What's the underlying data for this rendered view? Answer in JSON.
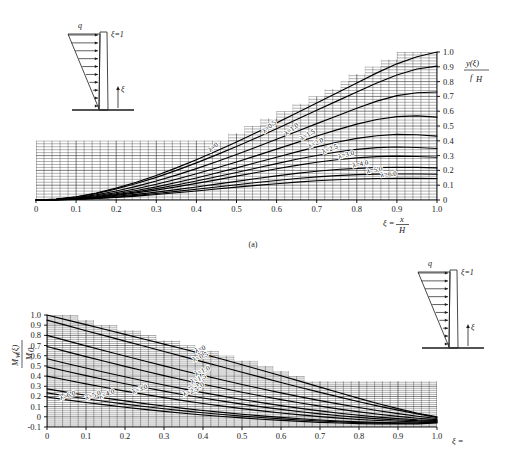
{
  "figure": {
    "panel_a_caption": "(a)",
    "lambda_prefix": "λ="
  },
  "chart_data": [
    {
      "type": "line",
      "id": "panel-a",
      "title": "",
      "xlabel": "ξ = x/H",
      "ylabel": "y(ξ)/f_H",
      "xlim": [
        0,
        1.0
      ],
      "ylim": [
        0,
        1.0
      ],
      "grid": true,
      "xticks": [
        0,
        0.1,
        0.2,
        0.3,
        0.4,
        0.5,
        0.6,
        0.7,
        0.8,
        0.9,
        1.0
      ],
      "xtick_labels": [
        "0",
        "0.1",
        "0.2",
        "0.3",
        "0.4",
        "0.5",
        "0.6",
        "0.7",
        "0.8",
        "0.9",
        "1.0"
      ],
      "yticks": [
        0,
        0.1,
        0.2,
        0.3,
        0.4,
        0.5,
        0.6,
        0.7,
        0.8,
        0.9,
        1.0
      ],
      "ytick_labels": [
        "0",
        "0.1",
        "0.2",
        "0.3",
        "0.4",
        "0.5",
        "0.6",
        "0.7",
        "0.8",
        "0.9",
        "1.0"
      ],
      "x": [
        0,
        0.05,
        0.1,
        0.15,
        0.2,
        0.25,
        0.3,
        0.35,
        0.4,
        0.45,
        0.5,
        0.55,
        0.6,
        0.65,
        0.7,
        0.75,
        0.8,
        0.85,
        0.9,
        0.95,
        1.0
      ],
      "series": [
        {
          "name": "λ=0",
          "label": "λ=0",
          "values": [
            0,
            0.006,
            0.022,
            0.047,
            0.08,
            0.12,
            0.166,
            0.217,
            0.272,
            0.331,
            0.392,
            0.456,
            0.521,
            0.588,
            0.655,
            0.723,
            0.791,
            0.859,
            0.92,
            0.968,
            1.0
          ]
        },
        {
          "name": "λ=0.5",
          "label": "λ=0.5",
          "values": [
            0,
            0.005,
            0.02,
            0.043,
            0.074,
            0.111,
            0.153,
            0.2,
            0.251,
            0.305,
            0.362,
            0.421,
            0.482,
            0.544,
            0.606,
            0.668,
            0.73,
            0.791,
            0.845,
            0.885,
            0.905
          ]
        },
        {
          "name": "λ=1.0",
          "label": "λ=1.0",
          "values": [
            0,
            0.004,
            0.016,
            0.035,
            0.061,
            0.092,
            0.128,
            0.168,
            0.212,
            0.258,
            0.307,
            0.358,
            0.41,
            0.463,
            0.516,
            0.568,
            0.62,
            0.668,
            0.705,
            0.725,
            0.73
          ]
        },
        {
          "name": "λ=1.5",
          "label": "λ=1.5",
          "values": [
            0,
            0.003,
            0.013,
            0.029,
            0.05,
            0.076,
            0.106,
            0.14,
            0.177,
            0.216,
            0.257,
            0.3,
            0.344,
            0.388,
            0.432,
            0.474,
            0.513,
            0.544,
            0.563,
            0.568,
            0.56
          ]
        },
        {
          "name": "λ=2.0",
          "label": "λ=2.0",
          "values": [
            0,
            0.003,
            0.011,
            0.024,
            0.042,
            0.064,
            0.089,
            0.118,
            0.149,
            0.182,
            0.217,
            0.253,
            0.289,
            0.325,
            0.359,
            0.39,
            0.416,
            0.434,
            0.443,
            0.441,
            0.432
          ]
        },
        {
          "name": "λ=2.5",
          "label": "λ=2.5",
          "values": [
            0,
            0.002,
            0.009,
            0.02,
            0.036,
            0.055,
            0.077,
            0.101,
            0.128,
            0.157,
            0.186,
            0.216,
            0.246,
            0.275,
            0.301,
            0.324,
            0.342,
            0.354,
            0.358,
            0.355,
            0.348
          ]
        },
        {
          "name": "λ=3.0",
          "label": "λ=3.0",
          "values": [
            0,
            0.002,
            0.008,
            0.018,
            0.031,
            0.048,
            0.067,
            0.089,
            0.112,
            0.136,
            0.161,
            0.186,
            0.211,
            0.234,
            0.255,
            0.272,
            0.285,
            0.293,
            0.296,
            0.294,
            0.289
          ]
        },
        {
          "name": "λ=4.0",
          "label": "λ=4.0",
          "values": [
            0,
            0.002,
            0.006,
            0.014,
            0.025,
            0.038,
            0.053,
            0.07,
            0.088,
            0.107,
            0.126,
            0.145,
            0.163,
            0.18,
            0.194,
            0.206,
            0.214,
            0.219,
            0.221,
            0.22,
            0.217
          ]
        },
        {
          "name": "λ=5.0",
          "label": "λ=5.0",
          "values": [
            0,
            0.001,
            0.005,
            0.011,
            0.02,
            0.031,
            0.044,
            0.058,
            0.073,
            0.088,
            0.103,
            0.118,
            0.132,
            0.145,
            0.156,
            0.165,
            0.171,
            0.175,
            0.176,
            0.176,
            0.174
          ]
        },
        {
          "name": "λ=6.0",
          "label": "λ=6.0",
          "values": [
            0,
            0.001,
            0.004,
            0.01,
            0.017,
            0.026,
            0.037,
            0.049,
            0.061,
            0.074,
            0.087,
            0.099,
            0.11,
            0.121,
            0.13,
            0.137,
            0.142,
            0.145,
            0.147,
            0.146,
            0.145
          ]
        }
      ]
    },
    {
      "type": "line",
      "id": "panel-b",
      "title": "",
      "xlabel": "ξ = x/H",
      "ylabel": "M_w(ξ)/M_0",
      "xlim": [
        0,
        1.0
      ],
      "ylim": [
        -0.1,
        1.0
      ],
      "grid": true,
      "xticks": [
        0,
        0.1,
        0.2,
        0.3,
        0.4,
        0.5,
        0.6,
        0.7,
        0.8,
        0.9,
        1.0
      ],
      "xtick_labels": [
        "0",
        "0.1",
        "0.2",
        "0.3",
        "0.4",
        "0.5",
        "0.6",
        "0.7",
        "0.8",
        "0.9",
        "1.0"
      ],
      "yticks": [
        -0.1,
        0,
        0.1,
        0.2,
        0.3,
        0.4,
        0.5,
        0.6,
        0.7,
        0.8,
        0.9,
        1.0
      ],
      "ytick_labels": [
        "-0.1",
        "0",
        "0.1",
        "0.2",
        "0.3",
        "0.4",
        "0.5",
        "0.6",
        "0.7",
        "0.8",
        "0.9",
        "1.0"
      ],
      "x": [
        0,
        0.05,
        0.1,
        0.15,
        0.2,
        0.25,
        0.3,
        0.35,
        0.4,
        0.45,
        0.5,
        0.55,
        0.6,
        0.65,
        0.7,
        0.75,
        0.8,
        0.85,
        0.9,
        0.95,
        1.0
      ],
      "series": [
        {
          "name": "λ=0",
          "label": "λ=0",
          "values": [
            1.0,
            0.952,
            0.905,
            0.857,
            0.81,
            0.762,
            0.714,
            0.666,
            0.616,
            0.565,
            0.512,
            0.458,
            0.403,
            0.348,
            0.292,
            0.236,
            0.181,
            0.128,
            0.08,
            0.035,
            0.0
          ]
        },
        {
          "name": "λ=0.5",
          "label": "λ=0.5",
          "values": [
            0.95,
            0.898,
            0.846,
            0.795,
            0.744,
            0.693,
            0.642,
            0.591,
            0.54,
            0.489,
            0.438,
            0.387,
            0.337,
            0.288,
            0.24,
            0.193,
            0.148,
            0.105,
            0.066,
            0.029,
            -0.005
          ]
        },
        {
          "name": "λ=1.0",
          "label": "λ=1.0",
          "values": [
            0.8,
            0.748,
            0.697,
            0.647,
            0.597,
            0.548,
            0.5,
            0.453,
            0.407,
            0.362,
            0.318,
            0.276,
            0.235,
            0.196,
            0.159,
            0.124,
            0.091,
            0.06,
            0.032,
            0.006,
            -0.016
          ]
        },
        {
          "name": "λ=1.5",
          "label": "λ=1.5",
          "values": [
            0.69,
            0.64,
            0.591,
            0.543,
            0.496,
            0.45,
            0.405,
            0.362,
            0.32,
            0.28,
            0.241,
            0.204,
            0.169,
            0.136,
            0.105,
            0.076,
            0.049,
            0.025,
            0.004,
            -0.014,
            -0.028
          ]
        },
        {
          "name": "λ=2.0",
          "label": "λ=2.0",
          "values": [
            0.57,
            0.524,
            0.479,
            0.435,
            0.393,
            0.352,
            0.312,
            0.274,
            0.238,
            0.203,
            0.17,
            0.139,
            0.11,
            0.083,
            0.058,
            0.035,
            0.015,
            -0.003,
            -0.018,
            -0.029,
            -0.035
          ]
        },
        {
          "name": "λ=2.5",
          "label": "λ=2.5",
          "values": [
            0.49,
            0.447,
            0.405,
            0.364,
            0.325,
            0.288,
            0.252,
            0.217,
            0.185,
            0.154,
            0.125,
            0.098,
            0.073,
            0.05,
            0.029,
            0.01,
            -0.006,
            -0.02,
            -0.031,
            -0.038,
            -0.04
          ]
        },
        {
          "name": "λ=3.0",
          "label": "λ=3.0",
          "values": [
            0.4,
            0.361,
            0.324,
            0.288,
            0.253,
            0.22,
            0.189,
            0.159,
            0.131,
            0.105,
            0.081,
            0.058,
            0.038,
            0.019,
            0.002,
            -0.013,
            -0.026,
            -0.036,
            -0.044,
            -0.048,
            -0.046
          ]
        },
        {
          "name": "λ=4.0",
          "label": "λ=4.0",
          "values": [
            0.275,
            0.243,
            0.212,
            0.183,
            0.156,
            0.13,
            0.106,
            0.083,
            0.062,
            0.043,
            0.025,
            0.009,
            -0.006,
            -0.019,
            -0.031,
            -0.041,
            -0.049,
            -0.055,
            -0.058,
            -0.058,
            -0.052
          ]
        },
        {
          "name": "λ=5.0",
          "label": "λ=5.0",
          "values": [
            0.235,
            0.205,
            0.177,
            0.15,
            0.125,
            0.101,
            0.079,
            0.059,
            0.04,
            0.023,
            0.007,
            -0.007,
            -0.02,
            -0.031,
            -0.041,
            -0.05,
            -0.057,
            -0.062,
            -0.064,
            -0.063,
            -0.056
          ]
        },
        {
          "name": "λ=6.0",
          "label": "λ=6.0",
          "values": [
            0.195,
            0.167,
            0.141,
            0.117,
            0.094,
            0.073,
            0.053,
            0.035,
            0.018,
            0.003,
            -0.011,
            -0.024,
            -0.035,
            -0.045,
            -0.054,
            -0.061,
            -0.067,
            -0.07,
            -0.071,
            -0.069,
            -0.06
          ]
        }
      ]
    }
  ],
  "inset_a": {
    "load_label": "q",
    "top_label": "ξ=1",
    "axis_label": "ξ"
  },
  "inset_b": {
    "load_label": "q",
    "top_label": "ξ=1",
    "axis_label": "ξ"
  },
  "axis_labels": {
    "xi_eq": "ξ =",
    "x_num": "x",
    "h_den": "H",
    "y_num": "y(ξ)",
    "y_den": "f",
    "y_den_sub": "H",
    "m_num": "M",
    "m_num_sub": "w",
    "m_num_arg": "(ξ)",
    "m_den": "M",
    "m_den_sub": "0"
  }
}
